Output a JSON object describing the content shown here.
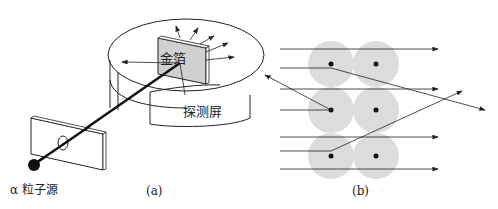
{
  "figure_a": {
    "caption": "(a)",
    "labels": {
      "gold_foil": "金箔",
      "detector_screen": "探测屏",
      "alpha_source": "α 粒子源"
    }
  },
  "figure_b": {
    "caption": "(b)",
    "nuclei_grid": {
      "rows": 3,
      "cols": 2
    }
  },
  "colors": {
    "line": "#222222",
    "atom_fill": "#dcdcdc",
    "foil_fill": "#d0d0d0"
  }
}
